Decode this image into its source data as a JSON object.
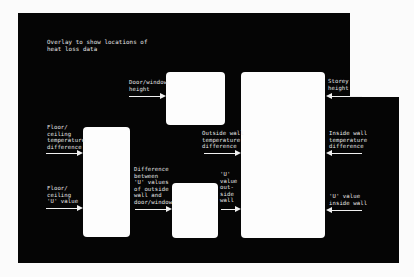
{
  "title": "Overlay to show locations of\nheat loss data",
  "colors": {
    "background": "#fbfbfb",
    "overlay": "#050505",
    "window": "#fdfdfd",
    "text": "#e8e8e8"
  },
  "labels": {
    "door_window_height": "Door/window\nheight",
    "storey_height": "Storey\nheight",
    "floor_ceiling_temp_diff": "Floor/\nceiling\ntemperature\ndifference",
    "floor_ceiling_u_value": "Floor/\nceiling\n'U' value",
    "outside_wall_temp_diff": "Outside wall\ntemperature\ndifference",
    "inside_wall_temp_diff": "Inside wall\ntemperature\ndifference",
    "diff_u_values": "Difference\nbetween\n'U' values\nof outside\nwall and\ndoor/window",
    "u_value_outside_wall": "'U'\nvalue\nout-\nside\nwall",
    "u_value_inside_wall": "'U' value\ninside wall"
  },
  "arrows": [
    {
      "id": "door-window-height",
      "direction": "right"
    },
    {
      "id": "storey-height",
      "direction": "left"
    },
    {
      "id": "floor-ceiling-temp",
      "direction": "right"
    },
    {
      "id": "floor-ceiling-u",
      "direction": "right"
    },
    {
      "id": "outside-wall-temp",
      "direction": "right"
    },
    {
      "id": "inside-wall-temp",
      "direction": "left"
    },
    {
      "id": "diff-u-values",
      "direction": "right"
    },
    {
      "id": "u-outside-wall",
      "direction": "right"
    },
    {
      "id": "u-inside-wall",
      "direction": "left"
    }
  ]
}
